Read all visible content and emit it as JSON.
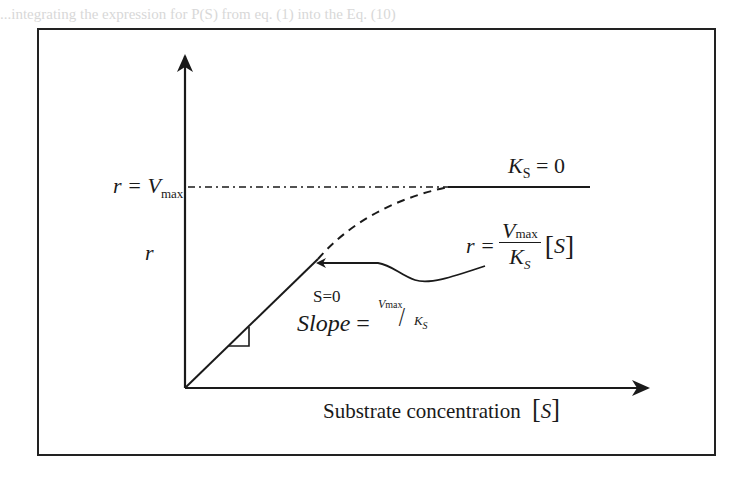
{
  "background_text": {
    "line1": "...integrating the expression for P(S) from eq. (1) into the Eq. (10)",
    "line2": "...are M|--K|S|...",
    "line3": "...(E) = K|S + [S] ..."
  },
  "diagram": {
    "y_axis_label": "r",
    "vmax_label": {
      "lhs": "r =",
      "var": "V",
      "sub": "max"
    },
    "ks_zero_label": {
      "var": "K",
      "sub": "S",
      "rhs": "= 0"
    },
    "equation_label": {
      "lhs": "r =",
      "num_var": "V",
      "num_sub": "max",
      "den_var": "K",
      "den_sub": "S",
      "bracket_open": "[",
      "bracket_var": "S",
      "bracket_close": "]"
    },
    "s_zero_label": "S=0",
    "slope_label": {
      "word": "Slope",
      "eq": "=",
      "num_var": "V",
      "num_sub": "max",
      "slash": "/",
      "den_var": "K",
      "den_sub": "S"
    },
    "x_axis_label": {
      "text": "Substrate concentration",
      "bracket_open": "[",
      "var": "S",
      "bracket_close": "]"
    }
  },
  "colors": {
    "ink": "#1a1a1a",
    "background": "#ffffff",
    "faded_text": "#d8d8d8"
  }
}
